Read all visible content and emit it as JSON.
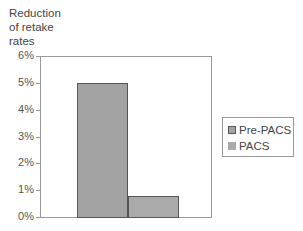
{
  "chart_data": {
    "type": "bar",
    "title": "",
    "ylabel": "Reduction of retake rates",
    "ylabel_lines": [
      "Reduction",
      "of retake",
      "rates"
    ],
    "xlabel": "",
    "categories": [
      ""
    ],
    "series": [
      {
        "name": "Pre-PACS",
        "values": [
          5.0
        ],
        "color": "#a3a3a3"
      },
      {
        "name": "PACS",
        "values": [
          0.8
        ],
        "color": "#aaaaaa"
      }
    ],
    "ylim": [
      0,
      6
    ],
    "yticks": [
      "0%",
      "1%",
      "2%",
      "3%",
      "4%",
      "5%",
      "6%"
    ],
    "grid": false,
    "legend_position": "right"
  },
  "legend": {
    "items": [
      {
        "label": "Pre-PACS"
      },
      {
        "label": "PACS"
      }
    ]
  }
}
